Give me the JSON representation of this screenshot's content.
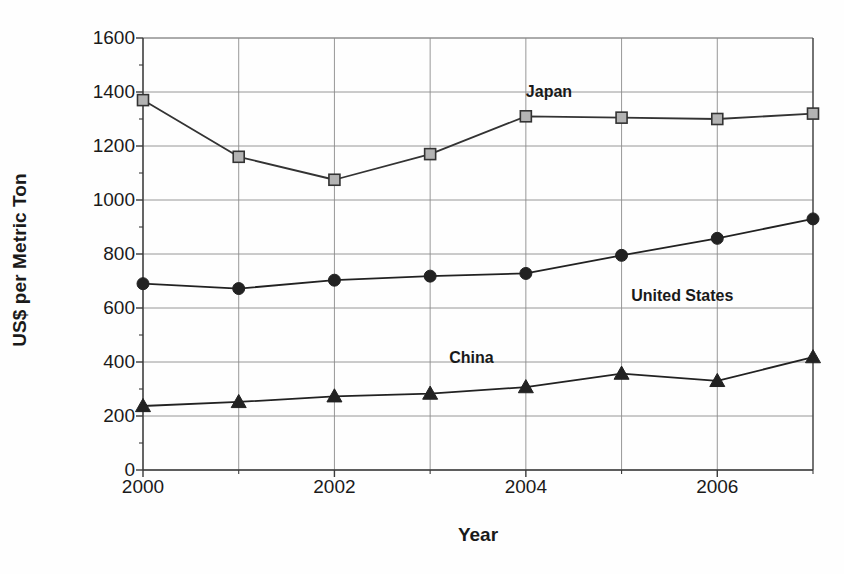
{
  "chart_data": {
    "type": "line",
    "title": "",
    "xlabel": "Year",
    "ylabel": "US$ per Metric Ton",
    "x": [
      2000,
      2001,
      2002,
      2003,
      2004,
      2005,
      2006,
      2007
    ],
    "xtick_labels": [
      "2000",
      "2002",
      "2004",
      "2006"
    ],
    "xtick_values": [
      2000,
      2002,
      2004,
      2006
    ],
    "xlim": [
      2000,
      2007
    ],
    "ytick_labels": [
      "0",
      "200",
      "400",
      "600",
      "800",
      "1000",
      "1200",
      "1400",
      "1600"
    ],
    "ytick_values": [
      0,
      200,
      400,
      600,
      800,
      1000,
      1200,
      1400,
      1600
    ],
    "ylim": [
      0,
      1600
    ],
    "grid": "both",
    "legend_position": "inline-annotations",
    "series": [
      {
        "name": "Japan",
        "marker": "square",
        "marker_fill": "#b3b3b3",
        "marker_edge": "#333333",
        "line_color": "#333333",
        "values": [
          1370,
          1160,
          1075,
          1170,
          1310,
          1305,
          1300,
          1320
        ],
        "label_x": 2004.0,
        "label_y": 1395
      },
      {
        "name": "United States",
        "marker": "circle",
        "marker_fill": "#222222",
        "marker_edge": "#222222",
        "line_color": "#222222",
        "values": [
          690,
          672,
          703,
          718,
          728,
          795,
          858,
          930
        ],
        "label_x": 2005.1,
        "label_y": 640
      },
      {
        "name": "China",
        "marker": "triangle",
        "marker_fill": "#222222",
        "marker_edge": "#222222",
        "line_color": "#222222",
        "values": [
          237,
          252,
          273,
          283,
          307,
          357,
          330,
          418
        ],
        "label_x": 2003.2,
        "label_y": 410
      }
    ],
    "colors": {
      "axis": "#3a3a3a",
      "grid": "#8c8c8c",
      "background": "#fefefe",
      "text": "#1a1a1a"
    }
  }
}
